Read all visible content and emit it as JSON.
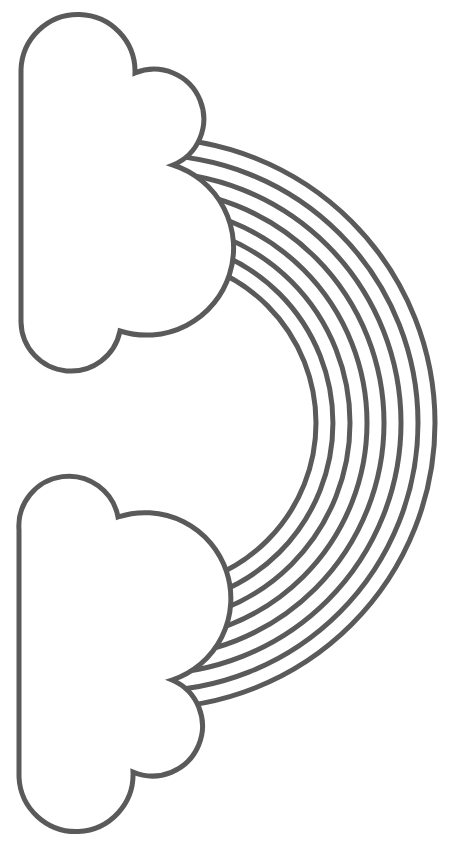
{
  "title": "Rainbow with two clouds coloring page",
  "colors": {
    "background": "#ffffff",
    "outline": "#5a5a5a",
    "fill": "#ffffff"
  },
  "rainbow": {
    "band_count": 8,
    "center": [
      150,
      423
    ],
    "radii": [
      285,
      268,
      251,
      234,
      217,
      200,
      183,
      166
    ],
    "stroke_width": 5
  },
  "clouds": [
    {
      "name": "top-cloud"
    },
    {
      "name": "bottom-cloud"
    }
  ]
}
